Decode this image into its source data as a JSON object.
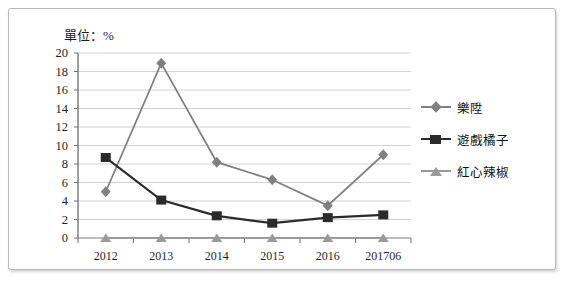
{
  "chart_data": {
    "type": "line",
    "title": "單位：%",
    "xlabel": "",
    "ylabel": "",
    "categories": [
      "2012",
      "2013",
      "2014",
      "2015",
      "2016",
      "201706"
    ],
    "yticks": [
      0,
      2,
      4,
      6,
      8,
      10,
      12,
      14,
      16,
      18,
      20
    ],
    "ylim": [
      0,
      20
    ],
    "grid": true,
    "legend_position": "right",
    "series": [
      {
        "name": "樂陞",
        "marker": "diamond",
        "color": "#808080",
        "values": [
          5.0,
          18.9,
          8.2,
          6.3,
          3.5,
          9.0
        ]
      },
      {
        "name": "遊戲橘子",
        "marker": "square",
        "color": "#2b2b2b",
        "values": [
          8.7,
          4.1,
          2.4,
          1.6,
          2.2,
          2.5
        ]
      },
      {
        "name": "紅心辣椒",
        "marker": "triangle",
        "color": "#9a9a9a",
        "values": [
          0.0,
          0.0,
          0.0,
          0.0,
          0.0,
          0.0
        ]
      }
    ]
  },
  "legend": {
    "items": [
      {
        "label": "樂陞",
        "icon": "diamond-marker-icon"
      },
      {
        "label": "遊戲橘子",
        "icon": "square-marker-icon"
      },
      {
        "label": "紅心辣椒",
        "icon": "triangle-marker-icon"
      }
    ]
  }
}
